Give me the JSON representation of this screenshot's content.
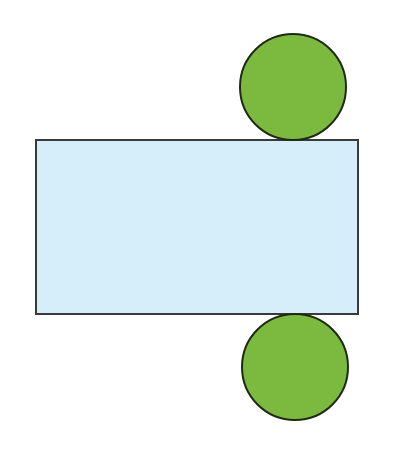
{
  "diagram": {
    "type": "cylinder-net",
    "width": 398,
    "height": 471,
    "background": "#ffffff",
    "rectangle": {
      "label": "lateral surface",
      "x": 36,
      "y": 140,
      "width": 322,
      "height": 174,
      "fill": "#d6eef9",
      "stroke": "#3a3a3a"
    },
    "top_circle": {
      "label": "top base",
      "cx": 293,
      "cy": 87,
      "r": 53,
      "fill": "#7cba3f",
      "stroke": "#1f2a14"
    },
    "bottom_circle": {
      "label": "bottom base",
      "cx": 295,
      "cy": 367,
      "r": 53,
      "fill": "#7cba3f",
      "stroke": "#1f2a14"
    }
  }
}
